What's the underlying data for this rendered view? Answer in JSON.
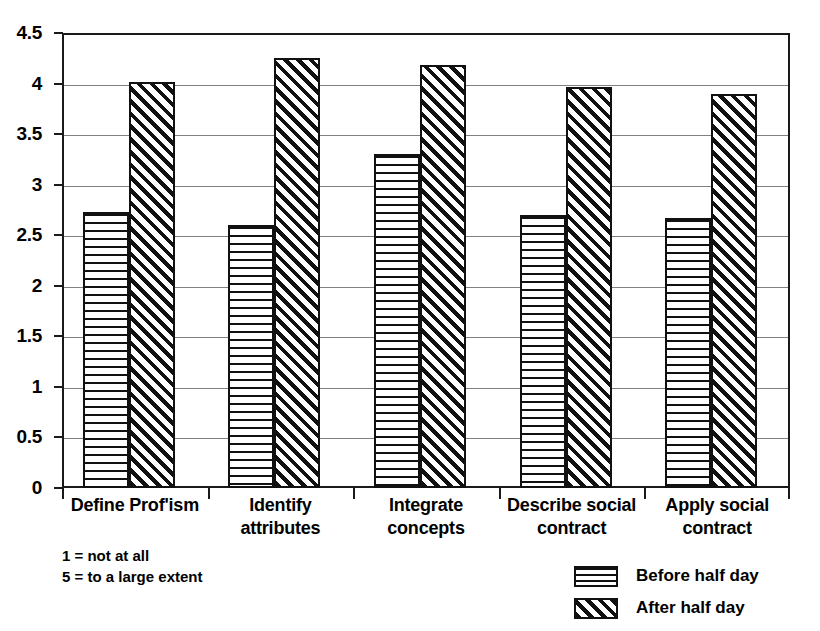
{
  "chart_data": {
    "type": "bar",
    "title": "",
    "subtitle": "",
    "xlabel": "",
    "ylabel": "",
    "categories": [
      "Define Prof'ism",
      "Identify attributes",
      "Integrate concepts",
      "Describe social contract",
      "Apply social contract"
    ],
    "series": [
      {
        "name": "Before half day",
        "pattern": "horizontal-lines",
        "values": [
          2.73,
          2.6,
          3.3,
          2.7,
          2.67
        ]
      },
      {
        "name": "After half day",
        "pattern": "diagonal-hatch",
        "values": [
          4.02,
          4.25,
          4.18,
          3.97,
          3.9
        ]
      }
    ],
    "ylim": [
      0,
      4.5
    ],
    "ytick_values": [
      0,
      0.5,
      1,
      1.5,
      2,
      2.5,
      3,
      3.5,
      4,
      4.5
    ],
    "ytick_labels": [
      "0",
      "0.5",
      "1",
      "1.5",
      "2",
      "2.5",
      "3",
      "3.5",
      "4",
      "4.5"
    ],
    "grid": "horizontal",
    "legend_position": "bottom-right",
    "annotations": [
      "1 = not at all",
      "5 = to a large extent"
    ],
    "colors": {
      "ink": "#111111",
      "grid": "#808080",
      "background": "#ffffff"
    }
  },
  "legend": {
    "items": [
      {
        "label": "Before half day"
      },
      {
        "label": "After half day"
      }
    ]
  },
  "footnotes": {
    "line1": "1 = not at all",
    "line2": "5 = to a large extent"
  }
}
